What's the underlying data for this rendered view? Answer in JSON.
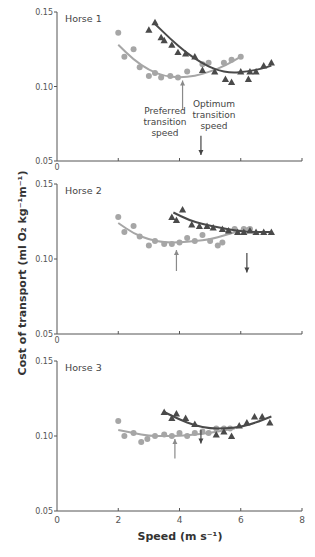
{
  "figure": {
    "ylabel": "Cost of transport (ml O₂ kg⁻¹m⁻¹)",
    "xlabel": "Speed (m s⁻¹)",
    "xticks": [
      "0",
      "2",
      "4",
      "6",
      "8"
    ],
    "yticks": [
      "0.05",
      "0.10",
      "0.15"
    ],
    "annotations": {
      "preferred": [
        "Preferred",
        "transition",
        "speed"
      ],
      "optimum": [
        "Optimum",
        "transition",
        "speed"
      ]
    },
    "colors": {
      "trot_series": "#a6a6a6",
      "gallop_series": "#4a4a4a",
      "axis": "#555555",
      "arrow_preferred": "#8a8a8a",
      "arrow_optimum": "#444444"
    }
  },
  "chart_data": [
    {
      "type": "scatter",
      "title": "Horse 1",
      "xlabel": "Speed (m s⁻¹)",
      "ylabel": "Cost of transport (ml O₂ kg⁻¹m⁻¹)",
      "xlim": [
        0,
        8
      ],
      "ylim": [
        0.05,
        0.15
      ],
      "series": [
        {
          "name": "trot",
          "marker": "circle",
          "color": "#a6a6a6",
          "x": [
            2.0,
            2.2,
            2.5,
            2.7,
            3.0,
            3.2,
            3.4,
            3.7,
            3.95,
            4.25,
            4.75,
            4.95,
            5.45,
            5.7,
            6.0
          ],
          "y": [
            0.136,
            0.12,
            0.125,
            0.113,
            0.107,
            0.109,
            0.106,
            0.107,
            0.106,
            0.11,
            0.115,
            0.116,
            0.116,
            0.118,
            0.12
          ],
          "fit": {
            "x": [
              2.0,
              2.5,
              3.0,
              3.5,
              4.0,
              4.5,
              5.0,
              5.5,
              6.0
            ],
            "y": [
              0.128,
              0.118,
              0.111,
              0.107,
              0.106,
              0.107,
              0.11,
              0.114,
              0.12
            ]
          }
        },
        {
          "name": "gallop",
          "marker": "triangle",
          "color": "#4a4a4a",
          "x": [
            3.0,
            3.2,
            3.4,
            3.5,
            3.75,
            3.95,
            4.2,
            4.5,
            4.75,
            5.15,
            5.5,
            5.7,
            6.0,
            6.25,
            6.3,
            6.5,
            6.75,
            7.0
          ],
          "y": [
            0.138,
            0.143,
            0.133,
            0.131,
            0.128,
            0.123,
            0.122,
            0.12,
            0.111,
            0.11,
            0.105,
            0.103,
            0.11,
            0.105,
            0.11,
            0.11,
            0.114,
            0.116
          ],
          "fit": {
            "x": [
              3.2,
              3.7,
              4.2,
              4.7,
              5.2,
              5.7,
              6.2,
              6.7,
              7.0
            ],
            "y": [
              0.142,
              0.132,
              0.123,
              0.116,
              0.111,
              0.109,
              0.11,
              0.112,
              0.114
            ]
          }
        }
      ],
      "arrows": [
        {
          "label": "Preferred transition speed",
          "x": 4.1,
          "direction": "up",
          "y_from": 0.085,
          "y_to": 0.104
        },
        {
          "label": "Optimum transition speed",
          "x": 4.7,
          "direction": "down",
          "y_from": 0.067,
          "y_to": 0.054
        }
      ]
    },
    {
      "type": "scatter",
      "title": "Horse 2",
      "xlabel": "",
      "ylabel": "",
      "xlim": [
        0,
        8
      ],
      "ylim": [
        0.05,
        0.15
      ],
      "series": [
        {
          "name": "trot",
          "marker": "circle",
          "color": "#a6a6a6",
          "x": [
            2.0,
            2.2,
            2.5,
            2.7,
            3.0,
            3.2,
            3.5,
            3.75,
            4.0,
            4.25,
            4.5,
            4.75,
            5.0,
            5.25,
            5.4,
            5.6,
            5.8,
            6.1,
            6.3
          ],
          "y": [
            0.128,
            0.118,
            0.122,
            0.115,
            0.109,
            0.112,
            0.11,
            0.11,
            0.111,
            0.114,
            0.112,
            0.116,
            0.112,
            0.109,
            0.111,
            0.118,
            0.12,
            0.12,
            0.12
          ],
          "fit": {
            "x": [
              2.0,
              2.5,
              3.0,
              3.5,
              4.0,
              4.5,
              5.0,
              5.5,
              6.0,
              6.3
            ],
            "y": [
              0.124,
              0.117,
              0.113,
              0.111,
              0.111,
              0.112,
              0.113,
              0.116,
              0.119,
              0.121
            ]
          }
        },
        {
          "name": "gallop",
          "marker": "triangle",
          "color": "#4a4a4a",
          "x": [
            3.75,
            3.9,
            4.1,
            4.4,
            4.65,
            4.9,
            5.1,
            5.4,
            5.6,
            5.9,
            6.1,
            6.3,
            6.5,
            6.75,
            7.0
          ],
          "y": [
            0.128,
            0.126,
            0.133,
            0.123,
            0.122,
            0.122,
            0.121,
            0.12,
            0.119,
            0.118,
            0.118,
            0.119,
            0.118,
            0.118,
            0.118
          ],
          "fit": {
            "x": [
              3.8,
              4.3,
              4.8,
              5.3,
              5.8,
              6.3,
              7.0
            ],
            "y": [
              0.131,
              0.126,
              0.123,
              0.121,
              0.119,
              0.118,
              0.118
            ]
          }
        }
      ],
      "arrows": [
        {
          "label": "Preferred transition speed",
          "x": 3.9,
          "direction": "up",
          "y_from": 0.092,
          "y_to": 0.106
        },
        {
          "label": "Optimum transition speed",
          "x": 6.2,
          "direction": "down",
          "y_from": 0.104,
          "y_to": 0.091
        }
      ]
    },
    {
      "type": "scatter",
      "title": "Horse 3",
      "xlabel": "Speed (m s⁻¹)",
      "ylabel": "",
      "xlim": [
        0,
        8
      ],
      "ylim": [
        0.05,
        0.15
      ],
      "xticks": [
        0,
        2,
        4,
        6,
        8
      ],
      "series": [
        {
          "name": "trot",
          "marker": "circle",
          "color": "#a6a6a6",
          "x": [
            2.0,
            2.2,
            2.5,
            2.75,
            2.95,
            3.2,
            3.5,
            3.75,
            4.0,
            4.25,
            4.5,
            4.75,
            4.95,
            5.2,
            5.45,
            5.65
          ],
          "y": [
            0.11,
            0.1,
            0.102,
            0.096,
            0.098,
            0.1,
            0.101,
            0.1,
            0.102,
            0.1,
            0.102,
            0.103,
            0.102,
            0.105,
            0.105,
            0.105
          ],
          "fit": {
            "x": [
              2.0,
              2.5,
              3.0,
              3.5,
              4.0,
              4.5,
              5.0,
              5.5,
              5.8
            ],
            "y": [
              0.104,
              0.102,
              0.1,
              0.1,
              0.1,
              0.101,
              0.102,
              0.104,
              0.105
            ]
          }
        },
        {
          "name": "gallop",
          "marker": "triangle",
          "color": "#4a4a4a",
          "x": [
            3.5,
            3.75,
            3.9,
            4.2,
            4.5,
            5.2,
            5.45,
            5.7,
            5.95,
            6.2,
            6.45,
            6.7,
            6.95
          ],
          "y": [
            0.116,
            0.112,
            0.115,
            0.112,
            0.108,
            0.101,
            0.103,
            0.1,
            0.107,
            0.109,
            0.113,
            0.113,
            0.109
          ],
          "fit": {
            "x": [
              3.5,
              4.0,
              4.5,
              5.0,
              5.5,
              6.0,
              6.5,
              7.0
            ],
            "y": [
              0.116,
              0.111,
              0.107,
              0.105,
              0.105,
              0.106,
              0.109,
              0.113
            ]
          }
        }
      ],
      "arrows": [
        {
          "label": "Preferred transition speed",
          "x": 3.85,
          "direction": "up",
          "y_from": 0.085,
          "y_to": 0.098
        },
        {
          "label": "Optimum transition speed",
          "x": 4.7,
          "direction": "down",
          "y_from": 0.104,
          "y_to": 0.095
        }
      ]
    }
  ]
}
